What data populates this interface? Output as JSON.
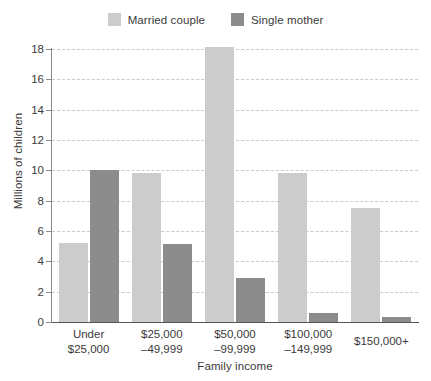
{
  "chart_data": {
    "type": "bar",
    "title": "",
    "xlabel": "Family income",
    "ylabel": "Millions of children",
    "categories": [
      "Under\n$25,000",
      "$25,000\n–49,999",
      "$50,000\n–99,999",
      "$100,000\n–149,999",
      "$150,000+"
    ],
    "category_lines": [
      [
        "Under",
        "$25,000"
      ],
      [
        "$25,000",
        "–49,999"
      ],
      [
        "$50,000",
        "–99,999"
      ],
      [
        "$100,000",
        "–149,999"
      ],
      [
        "$150,000+",
        ""
      ]
    ],
    "series": [
      {
        "name": "Married couple",
        "color": "#cccccc",
        "values": [
          5.2,
          9.8,
          18.1,
          9.8,
          7.5
        ]
      },
      {
        "name": "Single mother",
        "color": "#8c8c8c",
        "values": [
          10.0,
          5.15,
          2.9,
          0.6,
          0.3
        ]
      }
    ],
    "ylim": [
      0,
      18
    ],
    "yticks": [
      0,
      2,
      4,
      6,
      8,
      10,
      12,
      14,
      16,
      18
    ],
    "ytick_labels": [
      "0",
      "2",
      "4",
      "6",
      "8",
      "10",
      "12",
      "14",
      "16",
      "18"
    ],
    "grid": true,
    "grid_axis": "y",
    "grid_style": "dashed",
    "grid_color": "#c9c9c9",
    "legend_position": "top-center",
    "axis_color": "#555555",
    "background": "#ffffff"
  },
  "legend": {
    "entries": [
      {
        "label": "Married couple",
        "swatch_name": "legend-swatch-married-couple"
      },
      {
        "label": "Single mother",
        "swatch_name": "legend-swatch-single-mother"
      }
    ]
  }
}
